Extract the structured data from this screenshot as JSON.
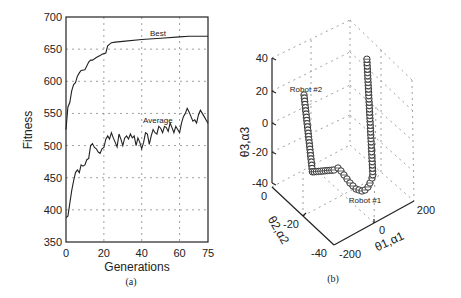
{
  "chart_data": [
    {
      "type": "line",
      "panel_caption": "(a)",
      "title": "",
      "xlabel": "Generations",
      "ylabel": "Fitness",
      "xlim": [
        0,
        75
      ],
      "ylim": [
        350,
        700
      ],
      "xticks": [
        0,
        20,
        40,
        60,
        75
      ],
      "yticks": [
        350,
        400,
        450,
        500,
        550,
        600,
        650,
        700
      ],
      "grid": true,
      "legend": "inline annotations",
      "annotations": [
        "Best",
        "Average"
      ],
      "series": [
        {
          "name": "Best",
          "x": [
            0,
            1,
            2,
            3,
            4,
            5,
            6,
            7,
            8,
            10,
            12,
            13,
            14,
            16,
            18,
            19,
            21,
            22,
            24,
            26,
            30,
            40,
            50,
            60,
            65,
            75
          ],
          "values": [
            525,
            560,
            567,
            585,
            595,
            598,
            608,
            613,
            617,
            618,
            630,
            633,
            633,
            637,
            640,
            642,
            644,
            655,
            660,
            661,
            662,
            665,
            667,
            669,
            670,
            670
          ]
        },
        {
          "name": "Average",
          "x": [
            0,
            1,
            2,
            3,
            4,
            5,
            6,
            7,
            8,
            9,
            10,
            11,
            12,
            13,
            14,
            15,
            16,
            17,
            18,
            19,
            20,
            21,
            22,
            23,
            24,
            25,
            26,
            27,
            28,
            29,
            30,
            31,
            32,
            33,
            34,
            35,
            36,
            37,
            38,
            39,
            40,
            41,
            42,
            43,
            44,
            45,
            46,
            47,
            48,
            49,
            50,
            51,
            52,
            53,
            54,
            55,
            56,
            57,
            58,
            59,
            60,
            61,
            62,
            63,
            64,
            65,
            66,
            67,
            68,
            69,
            70,
            71,
            72,
            73,
            74,
            75
          ],
          "values": [
            388,
            390,
            410,
            430,
            445,
            458,
            462,
            458,
            470,
            468,
            470,
            478,
            480,
            500,
            503,
            497,
            495,
            490,
            488,
            495,
            497,
            510,
            515,
            510,
            520,
            512,
            505,
            498,
            518,
            510,
            500,
            512,
            515,
            510,
            518,
            512,
            515,
            500,
            512,
            505,
            495,
            505,
            520,
            518,
            502,
            515,
            525,
            520,
            518,
            530,
            527,
            520,
            530,
            528,
            522,
            535,
            528,
            520,
            530,
            525,
            520,
            535,
            545,
            550,
            558,
            552,
            545,
            538,
            540,
            535,
            548,
            555,
            550,
            545,
            540,
            535
          ]
        }
      ]
    },
    {
      "type": "scatter3d",
      "panel_caption": "(b)",
      "title": "",
      "xlabel": "θ1, α1",
      "ylabel": "θ2, α2",
      "zlabel": "θ3, α3",
      "xlim": [
        -200,
        200
      ],
      "ylim": [
        -40,
        0
      ],
      "zlim": [
        -40,
        40
      ],
      "xticks": [
        -200,
        0,
        200
      ],
      "yticks": [
        -40,
        -20,
        0
      ],
      "zticks": [
        -40,
        -20,
        0,
        20,
        40
      ],
      "grid": true,
      "marker": "circle with cross",
      "annotations": [
        "Robot #2",
        "Robot #1"
      ],
      "series": [
        {
          "name": "Robot #2",
          "description": "trajectory descending from θ3≈20 to ≈-35, then moving along θ1"
        },
        {
          "name": "Robot #1",
          "description": "trajectory dipping to θ3≈-40 then rising to θ3≈40"
        }
      ]
    }
  ],
  "panel_a": {
    "ylabel": "Fitness",
    "xlabel": "Generations",
    "caption": "(a)",
    "yticks": [
      "700",
      "650",
      "600",
      "550",
      "500",
      "450",
      "400",
      "350"
    ],
    "xticks": [
      "0",
      "20",
      "40",
      "60",
      "75"
    ],
    "best_label": "Best",
    "average_label": "Average"
  },
  "panel_b": {
    "caption": "(b)",
    "zticks": [
      "40",
      "20",
      "0",
      "-20",
      "-40"
    ],
    "yticks": [
      "0",
      "-20",
      "-40"
    ],
    "xticks": [
      "-200",
      "0",
      "200"
    ],
    "zlabel": "θ3,α3",
    "ylabel": "θ2,α2",
    "xlabel": "θ1,α1",
    "robot2_label": "Robot #2",
    "robot1_label": "Robot #1"
  }
}
